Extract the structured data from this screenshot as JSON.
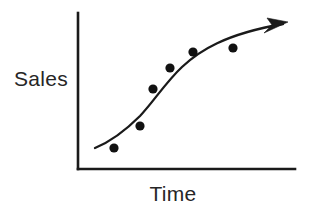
{
  "figure": {
    "name": "sales-over-time-trend-sketch",
    "background_color": "#ffffff",
    "ink_color": "#1a1a1a",
    "width": 309,
    "height": 212
  },
  "labels": {
    "y_axis": "Sales",
    "x_axis": "Time"
  },
  "chart_data": {
    "type": "scatter",
    "title": "",
    "subtitle": "",
    "xlabel": "Time",
    "ylabel": "Sales",
    "grid": false,
    "legend": false,
    "legend_position": "none",
    "axis_ticks": false,
    "tick_labels": {
      "x": [],
      "y": []
    },
    "xlim": [
      0,
      100
    ],
    "ylim": [
      0,
      100
    ],
    "series": [
      {
        "name": "Sales observations",
        "type": "scatter",
        "marker": "filled-circle",
        "marker_color": "#111111",
        "marker_radius_px": 4.6,
        "points": [
          {
            "x": 17,
            "y": 14
          },
          {
            "x": 29,
            "y": 28
          },
          {
            "x": 35,
            "y": 51
          },
          {
            "x": 42,
            "y": 65
          },
          {
            "x": 53,
            "y": 75
          },
          {
            "x": 71,
            "y": 78
          }
        ]
      },
      {
        "name": "Fitted trend",
        "type": "line",
        "style": "solid-with-arrowhead",
        "line_color": "#1a1a1a",
        "arrow_end": true,
        "shape": "s-curve-rising-then-flattening",
        "points": [
          {
            "x": 8,
            "y": 14
          },
          {
            "x": 20,
            "y": 26
          },
          {
            "x": 34,
            "y": 48
          },
          {
            "x": 48,
            "y": 68
          },
          {
            "x": 62,
            "y": 80
          },
          {
            "x": 78,
            "y": 88
          },
          {
            "x": 98,
            "y": 94
          }
        ]
      }
    ],
    "annotations": [
      {
        "name": "trend-arrowhead",
        "text": "",
        "at": {
          "x": 98,
          "y": 94
        }
      }
    ]
  },
  "geometry": {
    "y_axis": {
      "x": 78,
      "y_top": 13,
      "y_bottom": 169
    },
    "x_axis": {
      "y": 169,
      "x_left": 78,
      "x_right": 295
    },
    "curve_path": "M 95 148 C 112 141, 126 130, 140 116 C 154 101, 166 82, 182 67 C 199 51, 225 34, 283 24",
    "arrow_polygon": "288,22 267,18 272,25 264,33",
    "dots": [
      {
        "cx": 114,
        "cy": 148,
        "r": 4.6
      },
      {
        "cx": 140,
        "cy": 126,
        "r": 4.6
      },
      {
        "cx": 153,
        "cy": 89,
        "r": 4.6
      },
      {
        "cx": 170,
        "cy": 68,
        "r": 4.6
      },
      {
        "cx": 193,
        "cy": 52,
        "r": 4.6
      },
      {
        "cx": 233,
        "cy": 48,
        "r": 4.6
      }
    ],
    "y_label_anchor": {
      "x": 68,
      "y": 86
    },
    "x_label_anchor": {
      "x": 173,
      "y": 201
    }
  }
}
